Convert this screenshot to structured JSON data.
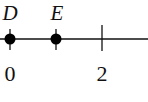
{
  "number_line": {
    "points": [
      {
        "name": "D",
        "value": 0
      },
      {
        "name": "E",
        "value": 1
      }
    ],
    "ticks": [
      {
        "value": 0,
        "label": "0"
      },
      {
        "value": 2,
        "label": "2"
      }
    ],
    "colors": {
      "line": "#111111",
      "point": "#000000",
      "background": "#ffffff"
    }
  }
}
